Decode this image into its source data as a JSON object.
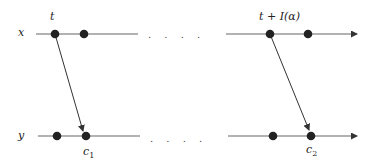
{
  "diagram": {
    "rows": [
      {
        "label": "x",
        "ellipsis": ". . . ."
      },
      {
        "label": "y",
        "ellipsis": ". . . ."
      }
    ],
    "events": {
      "send_1": "t",
      "send_2": "t + I(α)",
      "recv_1_base": "c",
      "recv_1_sub": "1",
      "recv_2_base": "c",
      "recv_2_sub": "2"
    },
    "colors": {
      "line": "#555555",
      "dot": "#222222",
      "arrow": "#333333"
    }
  }
}
